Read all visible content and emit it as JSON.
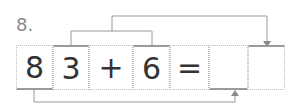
{
  "problem": {
    "number": "8.",
    "cells": [
      {
        "value": "8"
      },
      {
        "value": "3"
      },
      {
        "value": "+"
      },
      {
        "value": "6"
      },
      {
        "value": "="
      },
      {
        "value": ""
      },
      {
        "value": ""
      }
    ]
  },
  "colors": {
    "line": "#9a9a9a",
    "text": "#333333",
    "label": "#8a8a8a"
  }
}
